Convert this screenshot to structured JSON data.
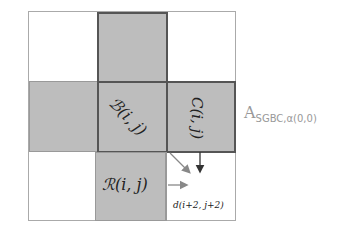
{
  "diagram": {
    "cells": {
      "B": {
        "label": "ℬ(i, j)"
      },
      "C": {
        "label": "C(i, j)"
      },
      "R": {
        "label": "ℛ(i, j)"
      },
      "d": {
        "label": "d(i+2, j+2)"
      }
    },
    "side_label": {
      "main": "A",
      "sub": "SGBC,α(0,0)"
    },
    "colors": {
      "fill": "#bdbdbd",
      "border": "#555555",
      "arrow": "#888888"
    }
  }
}
